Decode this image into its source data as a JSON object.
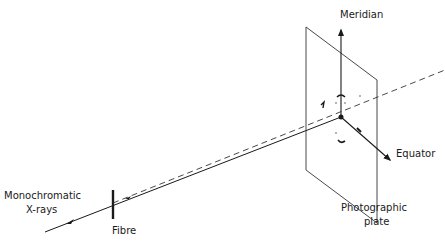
{
  "diagram": {
    "type": "fibre-diffraction-geometry",
    "labels": {
      "source_line1": "Monochromatic",
      "source_line2": "X-rays",
      "fibre": "Fibre",
      "meridian": "Meridian",
      "equator": "Equator",
      "plate_line1": "Photographic",
      "plate_line2": "plate"
    },
    "colors": {
      "line": "#1a1a1a",
      "background": "#ffffff"
    }
  }
}
